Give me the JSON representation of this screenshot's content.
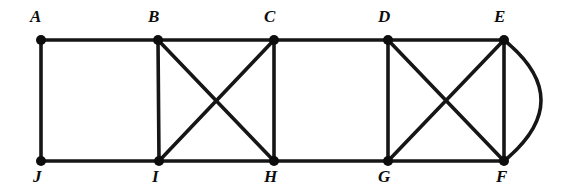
{
  "figure": {
    "kind": "undirected-graph-diagram",
    "width": 578,
    "height": 195,
    "background_color": "#ffffff",
    "stroke_color": "#161616",
    "vertex_color": "#0d0d0d",
    "vertex_radius": 5,
    "edge_width": 3.6
  },
  "vertices": [
    {
      "id": "A",
      "label": "A",
      "x": 41,
      "y": 40,
      "label_x": 30,
      "label_y": 8,
      "row": "top"
    },
    {
      "id": "B",
      "label": "B",
      "x": 158,
      "y": 40,
      "label_x": 148,
      "label_y": 8,
      "row": "top"
    },
    {
      "id": "C",
      "label": "C",
      "x": 274,
      "y": 40,
      "label_x": 264,
      "label_y": 8,
      "row": "top"
    },
    {
      "id": "D",
      "label": "D",
      "x": 388,
      "y": 40,
      "label_x": 378,
      "label_y": 8,
      "row": "top"
    },
    {
      "id": "E",
      "label": "E",
      "x": 504,
      "y": 40,
      "label_x": 494,
      "label_y": 8,
      "row": "top"
    },
    {
      "id": "J",
      "label": "J",
      "x": 41,
      "y": 161,
      "label_x": 33,
      "label_y": 168,
      "row": "bottom"
    },
    {
      "id": "I",
      "label": "I",
      "x": 159,
      "y": 161,
      "label_x": 152,
      "label_y": 168,
      "row": "bottom"
    },
    {
      "id": "H",
      "label": "H",
      "x": 274,
      "y": 161,
      "label_x": 264,
      "label_y": 168,
      "row": "bottom"
    },
    {
      "id": "G",
      "label": "G",
      "x": 388,
      "y": 161,
      "label_x": 378,
      "label_y": 168,
      "row": "bottom"
    },
    {
      "id": "F",
      "label": "F",
      "x": 504,
      "y": 161,
      "label_x": 496,
      "label_y": 168,
      "row": "bottom"
    }
  ],
  "edges": [
    {
      "from": "A",
      "to": "B",
      "type": "straight",
      "group": "top-path"
    },
    {
      "from": "B",
      "to": "C",
      "type": "straight",
      "group": "top-path"
    },
    {
      "from": "C",
      "to": "D",
      "type": "straight",
      "group": "top-path"
    },
    {
      "from": "D",
      "to": "E",
      "type": "straight",
      "group": "top-path"
    },
    {
      "from": "J",
      "to": "I",
      "type": "straight",
      "group": "bottom-path"
    },
    {
      "from": "I",
      "to": "H",
      "type": "straight",
      "group": "bottom-path"
    },
    {
      "from": "H",
      "to": "G",
      "type": "straight",
      "group": "bottom-path"
    },
    {
      "from": "G",
      "to": "F",
      "type": "straight",
      "group": "bottom-path"
    },
    {
      "from": "A",
      "to": "J",
      "type": "straight",
      "group": "rung"
    },
    {
      "from": "B",
      "to": "I",
      "type": "straight",
      "group": "rung"
    },
    {
      "from": "C",
      "to": "H",
      "type": "straight",
      "group": "rung"
    },
    {
      "from": "D",
      "to": "G",
      "type": "straight",
      "group": "rung"
    },
    {
      "from": "E",
      "to": "F",
      "type": "straight",
      "group": "rung"
    },
    {
      "from": "B",
      "to": "H",
      "type": "straight",
      "group": "diagonal"
    },
    {
      "from": "C",
      "to": "I",
      "type": "straight",
      "group": "diagonal"
    },
    {
      "from": "D",
      "to": "F",
      "type": "straight",
      "group": "diagonal"
    },
    {
      "from": "E",
      "to": "G",
      "type": "straight",
      "group": "diagonal"
    },
    {
      "from": "E",
      "to": "F",
      "type": "curved",
      "group": "multi-edge",
      "bulge": "right",
      "control_x": 578,
      "control_y": 100
    }
  ]
}
